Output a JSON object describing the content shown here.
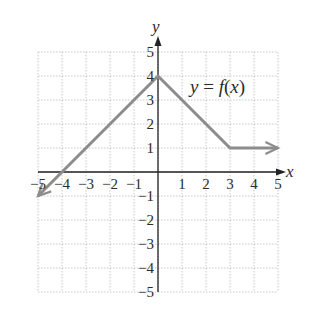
{
  "chart_data": {
    "type": "line",
    "title": "",
    "xlabel": "x",
    "ylabel": "y",
    "xlim": [
      -5,
      5
    ],
    "ylim": [
      -5,
      5
    ],
    "grid": true,
    "x_ticks": [
      -5,
      -4,
      -3,
      -2,
      -1,
      1,
      2,
      3,
      4,
      5
    ],
    "y_ticks": [
      5,
      4,
      3,
      2,
      1,
      -1,
      -2,
      -3,
      -4,
      -5
    ],
    "x_tick_labels": [
      "−5",
      "−4",
      "−3",
      "−2",
      "−1",
      "1",
      "2",
      "3",
      "4",
      "5"
    ],
    "y_tick_labels": [
      "5",
      "4",
      "3",
      "2",
      "1",
      "−1",
      "−2",
      "−3",
      "−4",
      "−5"
    ],
    "series": [
      {
        "name": "y = f(x)",
        "points": [
          [
            -5,
            -1
          ],
          [
            0,
            4
          ],
          [
            3,
            1
          ],
          [
            5,
            1
          ]
        ],
        "left_arrow": true,
        "right_arrow": true,
        "color": "#8c8c8c"
      }
    ],
    "annotations": [
      {
        "text": "y = f(x)",
        "x": 3.2,
        "y": 3.5
      }
    ]
  },
  "labels": {
    "x_axis": "x",
    "y_axis": "y",
    "function": "y = f(x)"
  },
  "colors": {
    "grid": "#c8c8c8",
    "axis": "#222222",
    "curve": "#8c8c8c"
  }
}
